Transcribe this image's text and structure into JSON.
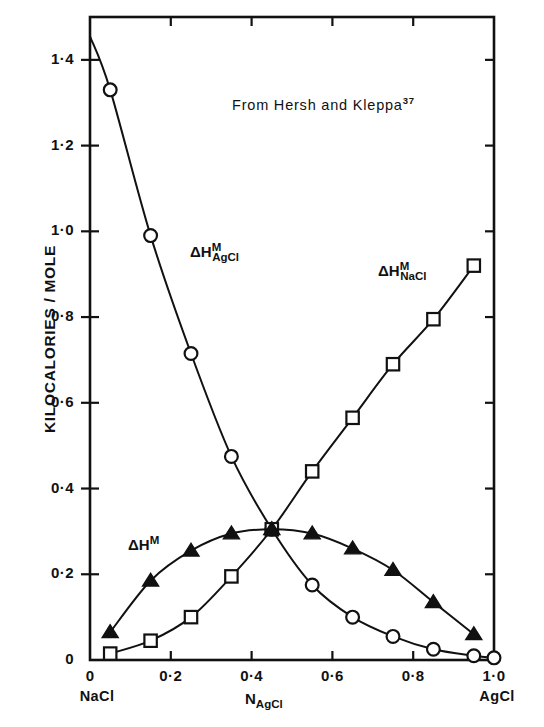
{
  "chart_data": {
    "type": "scatter",
    "title": "",
    "annotation": "From Hersh and Kleppa",
    "annotation_superscript": "37",
    "xlabel_main": "N",
    "xlabel_sub": "AgCl",
    "ylabel": "KILOCALORIES / MOLE",
    "xlim": [
      0,
      1.0
    ],
    "ylim": [
      0,
      1.5
    ],
    "grid": false,
    "legend_position": "inline-labels",
    "x_ticks": [
      "0",
      "0·2",
      "0·4",
      "0·6",
      "0·8",
      "1·0"
    ],
    "x_tick_values": [
      0,
      0.2,
      0.4,
      0.6,
      0.8,
      1.0
    ],
    "y_ticks": [
      "0",
      "0·2",
      "0·4",
      "0·6",
      "0·8",
      "1·0",
      "1·2",
      "1·4"
    ],
    "y_tick_values": [
      0,
      0.2,
      0.4,
      0.6,
      0.8,
      1.0,
      1.2,
      1.4
    ],
    "x_end_left": "NaCl",
    "x_end_right": "AgCl",
    "series": [
      {
        "name": "dH-M-AgCl",
        "label_main": "ΔH",
        "label_sup": "M",
        "label_sub": "AgCl",
        "marker": "open-circle",
        "x": [
          0.05,
          0.15,
          0.25,
          0.35,
          0.45,
          0.55,
          0.65,
          0.75,
          0.85,
          0.95,
          1.0
        ],
        "y": [
          1.33,
          0.99,
          0.715,
          0.475,
          0.305,
          0.175,
          0.1,
          0.055,
          0.025,
          0.01,
          0.005
        ],
        "curve_start": [
          0.0,
          1.455
        ]
      },
      {
        "name": "dH-M-NaCl",
        "label_main": "ΔH",
        "label_sup": "M",
        "label_sub": "NaCl",
        "marker": "open-square",
        "x": [
          0.05,
          0.15,
          0.25,
          0.35,
          0.45,
          0.55,
          0.65,
          0.75,
          0.85,
          0.95
        ],
        "y": [
          0.015,
          0.045,
          0.1,
          0.195,
          0.305,
          0.44,
          0.565,
          0.69,
          0.795,
          0.92
        ]
      },
      {
        "name": "dH-M",
        "label_main": "ΔH",
        "label_sup": "M",
        "label_sub": "",
        "marker": "filled-triangle",
        "x": [
          0.05,
          0.15,
          0.25,
          0.35,
          0.45,
          0.55,
          0.65,
          0.75,
          0.85,
          0.95
        ],
        "y": [
          0.065,
          0.185,
          0.255,
          0.295,
          0.305,
          0.295,
          0.26,
          0.21,
          0.135,
          0.06
        ]
      }
    ]
  }
}
